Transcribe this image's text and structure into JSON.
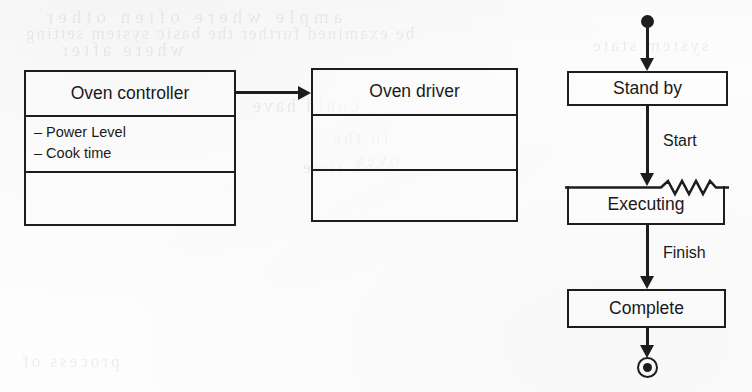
{
  "figure": {
    "kind": "uml-class-and-state-diagram",
    "stroke_color": "#1d1d1d",
    "paper_color": "#fdfdfd"
  },
  "class_diagram": {
    "classes": [
      {
        "name": "Oven controller",
        "attributes": [
          "– Power Level",
          "– Cook time"
        ],
        "operations": []
      },
      {
        "name": "Oven driver",
        "attributes": [],
        "operations": []
      }
    ],
    "association": {
      "from": "Oven controller",
      "to": "Oven driver",
      "arrow": "open-arrow-right"
    }
  },
  "state_diagram": {
    "initial_marker": "filled-circle",
    "final_marker": "bullseye-circle",
    "states": [
      {
        "name": "Stand by",
        "notched": false
      },
      {
        "name": "Executing",
        "notched": true
      },
      {
        "name": "Complete",
        "notched": false
      }
    ],
    "transitions": [
      {
        "from": "initial",
        "to": "Stand by",
        "label": ""
      },
      {
        "from": "Stand by",
        "to": "Executing",
        "label": "Start"
      },
      {
        "from": "Executing",
        "to": "Complete",
        "label": "Finish"
      },
      {
        "from": "Complete",
        "to": "final",
        "label": ""
      }
    ]
  },
  "scan_artifacts": {
    "ghost_lines": [
      "be examined further the basic  system  setting",
      "ample where often other",
      "where after",
      "could have",
      "in the",
      "oven",
      "cook time",
      "system state",
      "process of"
    ]
  }
}
